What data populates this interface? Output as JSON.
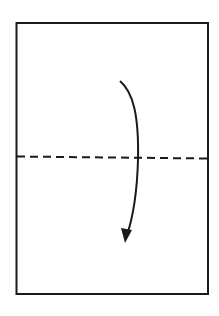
{
  "diagram": {
    "type": "origami-fold-step",
    "paper": {
      "shape": "rectangle",
      "stroke": "#1a1a1a"
    },
    "fold_line": {
      "style": "dashed",
      "label": "valley fold",
      "orientation": "horizontal"
    },
    "arrow": {
      "direction": "down",
      "meaning": "fold top half down"
    },
    "colors": {
      "line": "#1a1a1a",
      "background": "#ffffff"
    }
  }
}
